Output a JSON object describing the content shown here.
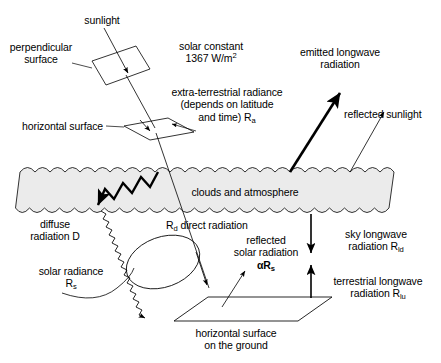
{
  "figure": {
    "background_color": "#ffffff",
    "line_color": "#000000",
    "cloud_band_fill": "#ebebeb"
  },
  "labels": {
    "sunlight": "sunlight",
    "perpendicular_surface_line1": "perpendicular",
    "perpendicular_surface_line2": "surface",
    "solar_constant_line1": "solar constant",
    "solar_constant_value": "1367 W/m",
    "solar_constant_exponent": "2",
    "extra_terrestrial_line1": "extra-terrestrial radiance",
    "extra_terrestrial_line2": "(depends on latitude",
    "extra_terrestrial_line3": "and time) R",
    "extra_terrestrial_sub": "a",
    "horizontal_surface_top": "horizontal surface",
    "emitted_longwave_line1": "emitted longwave",
    "emitted_longwave_line2": "radiation",
    "reflected_sunlight": "reflected sunlight",
    "clouds_and_atmosphere": "clouds and atmosphere",
    "diffuse_line1": "diffuse",
    "diffuse_line2": "radiation D",
    "direct_radiation_symbol": "R",
    "direct_radiation_sub": "d",
    "direct_radiation_text": " direct radiation",
    "reflected_solar_line1": "reflected",
    "reflected_solar_line2": "solar radiation",
    "reflected_solar_symbol_alpha": "αR",
    "reflected_solar_sub": "s",
    "sky_longwave_line1": "sky longwave",
    "sky_longwave_line2": "radiation R",
    "sky_longwave_sub": "ld",
    "terrestrial_longwave_line1": "terrestrial longwave",
    "terrestrial_longwave_line2": "radiation R",
    "terrestrial_longwave_sub": "lu",
    "solar_radiance_line1": "solar radiance",
    "solar_radiance_symbol": "R",
    "solar_radiance_sub": "s",
    "ground_surface_line1": "horizontal surface",
    "ground_surface_line2": "on the ground"
  },
  "elements": {
    "perpendicular_surface_shape": "parallelogram-tilted",
    "horizontal_surface_top_shape": "parallelogram-flat",
    "ground_surface_shape": "parallelogram-flat",
    "cloud_band_shape": "scalloped-band",
    "sunlight_ray": "thin-arrow-down-right",
    "emitted_longwave_ray": "thick-arrow-up-right",
    "reflected_sunlight_ray": "thin-arrow-up-right",
    "diffuse_ray": "zigzag-arrow-down-left",
    "solar_radiance_ray": "sawtooth-arrow-down-right",
    "direct_radiation_ray": "thin-arrow-down-right",
    "reflected_solar_ray": "thin-arrow-up-right",
    "sky_longwave_ray": "arrow-down",
    "terrestrial_longwave_ray": "arrow-up",
    "solid_angle_ellipse": "ellipse-outline",
    "solid_angle_bracket": "curved-leader"
  }
}
